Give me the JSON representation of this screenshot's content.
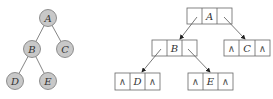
{
  "tree": {
    "nodes": [
      {
        "id": "A",
        "label": "A"
      },
      {
        "id": "B",
        "label": "B"
      },
      {
        "id": "C",
        "label": "C"
      },
      {
        "id": "D",
        "label": "D"
      },
      {
        "id": "E",
        "label": "E"
      }
    ],
    "edges": [
      [
        "A",
        "B"
      ],
      [
        "A",
        "C"
      ],
      [
        "B",
        "D"
      ],
      [
        "B",
        "E"
      ]
    ]
  },
  "linked": {
    "null_symbol": "∧",
    "nodes": [
      {
        "id": "A",
        "label": "A",
        "left": "",
        "right": ""
      },
      {
        "id": "B",
        "label": "B",
        "left": "",
        "right": ""
      },
      {
        "id": "C",
        "label": "C",
        "left": "∧",
        "right": "∧"
      },
      {
        "id": "D",
        "label": "D",
        "left": "∧",
        "right": "∧"
      },
      {
        "id": "E",
        "label": "E",
        "left": "∧",
        "right": "∧"
      }
    ]
  },
  "colors": {
    "circle_fill": "#c8c8c8",
    "circle_stroke": "#777777",
    "line": "#666666",
    "box_stroke": "#666666"
  }
}
